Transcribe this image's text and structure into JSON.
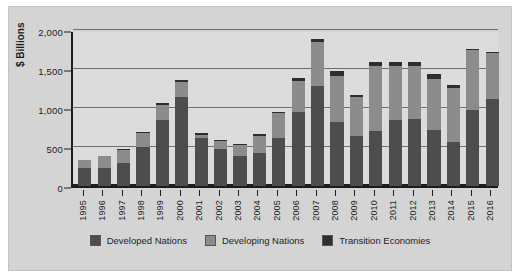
{
  "chart_data": {
    "type": "bar",
    "stacked": true,
    "title": "",
    "xlabel": "",
    "ylabel": "$ Billions",
    "ylim": [
      0,
      2000
    ],
    "yticks": [
      0,
      500,
      1000,
      1500,
      2000
    ],
    "ytick_labels": [
      "0",
      "500",
      "1,000",
      "1,500",
      "2,000"
    ],
    "grid": true,
    "legend_position": "bottom",
    "categories": [
      "1995",
      "1996",
      "1997",
      "1998",
      "1999",
      "2000",
      "2001",
      "2002",
      "2003",
      "2004",
      "2005",
      "2006",
      "2007",
      "2008",
      "2009",
      "2010",
      "2011",
      "2012",
      "2013",
      "2014",
      "2015",
      "2016"
    ],
    "series": [
      {
        "name": "Developed Nations",
        "color": "#4d4d4d",
        "values": [
          225,
          230,
          300,
          500,
          850,
          1140,
          620,
          480,
          380,
          420,
          620,
          950,
          1280,
          820,
          640,
          700,
          840,
          860,
          720,
          560,
          980,
          1120
        ]
      },
      {
        "name": "Developing Nations",
        "color": "#8c8c8c",
        "values": [
          110,
          150,
          165,
          180,
          195,
          195,
          40,
          95,
          140,
          225,
          310,
          400,
          570,
          590,
          500,
          840,
          700,
          680,
          650,
          700,
          760,
          580
        ]
      },
      {
        "name": "Transition Economies",
        "color": "#2e2e2e",
        "values": [
          5,
          10,
          10,
          10,
          20,
          20,
          15,
          20,
          20,
          20,
          20,
          30,
          40,
          60,
          30,
          50,
          50,
          50,
          60,
          40,
          20,
          20
        ]
      }
    ],
    "totals": [
      340,
      390,
      475,
      690,
      1065,
      1355,
      675,
      595,
      540,
      665,
      950,
      1380,
      1890,
      1470,
      1170,
      1590,
      1590,
      1590,
      1430,
      1300,
      1760,
      1720
    ]
  },
  "legend": {
    "items": [
      {
        "label": "Developed Nations",
        "key": "developed"
      },
      {
        "label": "Developing Nations",
        "key": "developing"
      },
      {
        "label": "Transition Economies",
        "key": "transition"
      }
    ]
  }
}
